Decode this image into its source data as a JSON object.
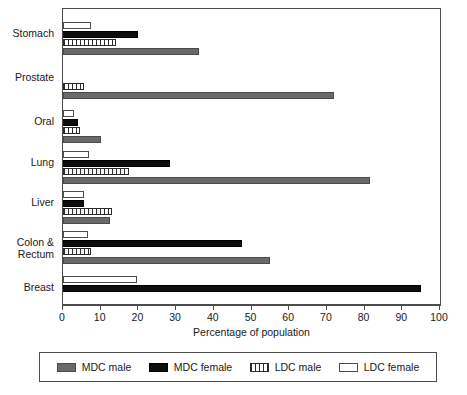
{
  "chart_data": {
    "type": "bar",
    "orientation": "horizontal",
    "title": "",
    "xlabel": "Percentage of population",
    "ylabel": "",
    "xlim": [
      0,
      100
    ],
    "xticks": [
      0,
      10,
      20,
      30,
      40,
      50,
      60,
      70,
      80,
      90,
      100
    ],
    "grid": false,
    "legend_position": "bottom",
    "categories": [
      "Stomach",
      "Prostate",
      "Oral",
      "Lung",
      "Liver",
      "Colon &\nRectum",
      "Breast"
    ],
    "series": [
      {
        "name": "MDC male",
        "color": "#6a6a6a",
        "pattern": "solid-gray",
        "values": [
          36,
          72,
          10,
          81.5,
          12.5,
          55,
          null
        ]
      },
      {
        "name": "MDC female",
        "color": "#0d0d0d",
        "pattern": "solid-black",
        "values": [
          20,
          null,
          4,
          28.5,
          5.5,
          47.5,
          95
        ]
      },
      {
        "name": "LDC male",
        "color": "#2b2b2b",
        "pattern": "vertical-stripes",
        "values": [
          14,
          5.5,
          4.5,
          17.5,
          13,
          7.5,
          null
        ]
      },
      {
        "name": "LDC female",
        "color": "#ffffff",
        "pattern": "open-outline",
        "values": [
          7.5,
          null,
          3,
          7,
          5.5,
          6.5,
          19.5
        ]
      }
    ]
  },
  "axis": {
    "x_title": "Percentage of population",
    "tick_labels": [
      "0",
      "10",
      "20",
      "30",
      "40",
      "50",
      "60",
      "70",
      "80",
      "90",
      "100"
    ]
  },
  "categories": {
    "labels": [
      "Stomach",
      "Prostate",
      "Oral",
      "Lung",
      "Liver",
      "Colon &\nRectum",
      "Breast"
    ]
  },
  "legend": {
    "items": [
      {
        "label": "MDC male",
        "swatch": "mdc-male-swatch"
      },
      {
        "label": "MDC female",
        "swatch": "mdc-female-swatch"
      },
      {
        "label": "LDC male",
        "swatch": "ldc-male-swatch"
      },
      {
        "label": "LDC female",
        "swatch": "ldc-female-swatch"
      }
    ]
  },
  "colors": {
    "mdc_male": "#6a6a6a",
    "mdc_female": "#0d0d0d",
    "ldc_male": "#2b2b2b",
    "ldc_female": "#ffffff",
    "frame": "#4d4d4d"
  }
}
